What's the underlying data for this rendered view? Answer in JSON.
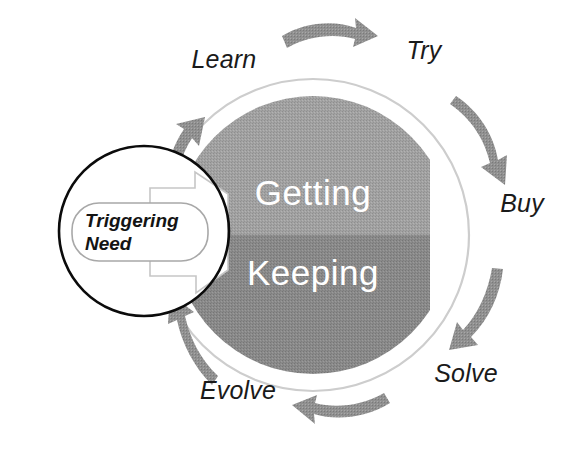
{
  "diagram": {
    "type": "cycle-diagram",
    "core": {
      "top_half_label": "Getting",
      "bottom_half_label": "Keeping",
      "top_half_color": "#9a9a9a",
      "bottom_half_color": "#848484",
      "outer_ring_color": "#cfcfcf"
    },
    "trigger": {
      "line1": "Triggering",
      "line2": "Need",
      "circle_stroke_color": "#000000",
      "callout_fill": "#ffffff",
      "callout_stroke": "#b0b0b0"
    },
    "stages": [
      {
        "id": "learn",
        "label": "Learn",
        "x": 224,
        "y": 68
      },
      {
        "id": "try",
        "label": "Try",
        "x": 424,
        "y": 59
      },
      {
        "id": "buy",
        "label": "Buy",
        "x": 522,
        "y": 212
      },
      {
        "id": "solve",
        "label": "Solve",
        "x": 466,
        "y": 382
      },
      {
        "id": "evolve",
        "label": "Evolve",
        "x": 238,
        "y": 399
      }
    ],
    "arrows": [
      {
        "id": "arrow-top",
        "direction": "clockwise",
        "color": "#8c8c8c"
      },
      {
        "id": "arrow-upper-right",
        "direction": "clockwise",
        "color": "#8c8c8c"
      },
      {
        "id": "arrow-lower-right",
        "direction": "clockwise",
        "color": "#8c8c8c"
      },
      {
        "id": "arrow-bottom",
        "direction": "clockwise",
        "color": "#8c8c8c"
      },
      {
        "id": "arrow-lower-left",
        "direction": "clockwise",
        "color": "#8c8c8c"
      },
      {
        "id": "arrow-upper-left",
        "direction": "clockwise",
        "color": "#8c8c8c"
      }
    ],
    "colors": {
      "background": "#ffffff",
      "arrow_gray": "#8c8c8c",
      "text_dark": "#1a1a1a",
      "text_light": "#ffffff"
    }
  }
}
